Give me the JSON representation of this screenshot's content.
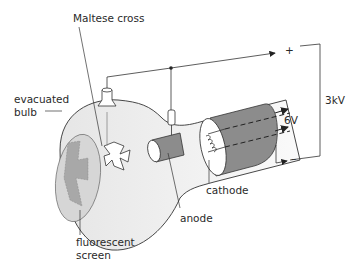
{
  "diagram": {
    "labels": {
      "maltese_cross": "Maltese cross",
      "evacuated_bulb_1": "evacuated",
      "evacuated_bulb_2": "bulb",
      "fluorescent_screen_1": "fluorescent",
      "fluorescent_screen_2": "screen",
      "anode": "anode",
      "cathode": "cathode",
      "heater_voltage": "6V",
      "accelerating_voltage": "3kV",
      "plus": "+",
      "minus": "–"
    },
    "colors": {
      "line": "#333333",
      "bulb_fill": "#f2f2f2",
      "screen_fill": "#d6d6d6",
      "shadow_fill": "#a8a8a8",
      "electrode_fill": "#8c8c8c"
    }
  }
}
